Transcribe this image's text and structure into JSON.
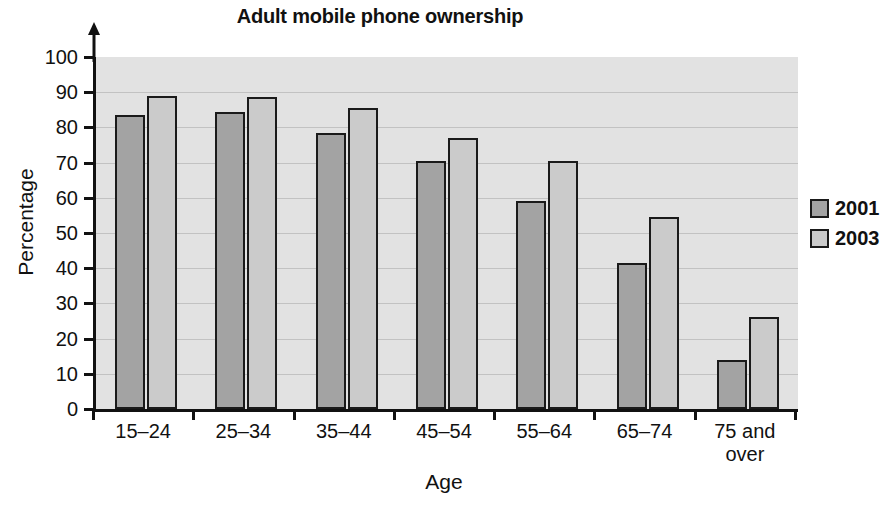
{
  "chart_data": {
    "type": "bar",
    "title": "Adult mobile phone ownership",
    "xlabel": "Age",
    "ylabel": "Percentage",
    "categories": [
      "15–24",
      "25–34",
      "35–44",
      "45–54",
      "55–64",
      "65–74",
      "75 and\nover"
    ],
    "series": [
      {
        "name": "2001",
        "color": "#a3a3a3",
        "values": [
          83.5,
          84.5,
          78.5,
          70.5,
          59,
          41.5,
          14
        ]
      },
      {
        "name": "2003",
        "color": "#cbcbcb",
        "values": [
          89,
          88.5,
          85.5,
          77,
          70.5,
          54.5,
          26
        ]
      }
    ],
    "ylim": [
      0,
      100
    ],
    "ytick_step": 10,
    "yticks": [
      "100",
      "90",
      "80",
      "70",
      "60",
      "50",
      "40",
      "30",
      "20",
      "10",
      "0"
    ],
    "grid": true,
    "legend_position": "right",
    "plot_background": "#e2e2e2",
    "axis_color": "#111111"
  }
}
